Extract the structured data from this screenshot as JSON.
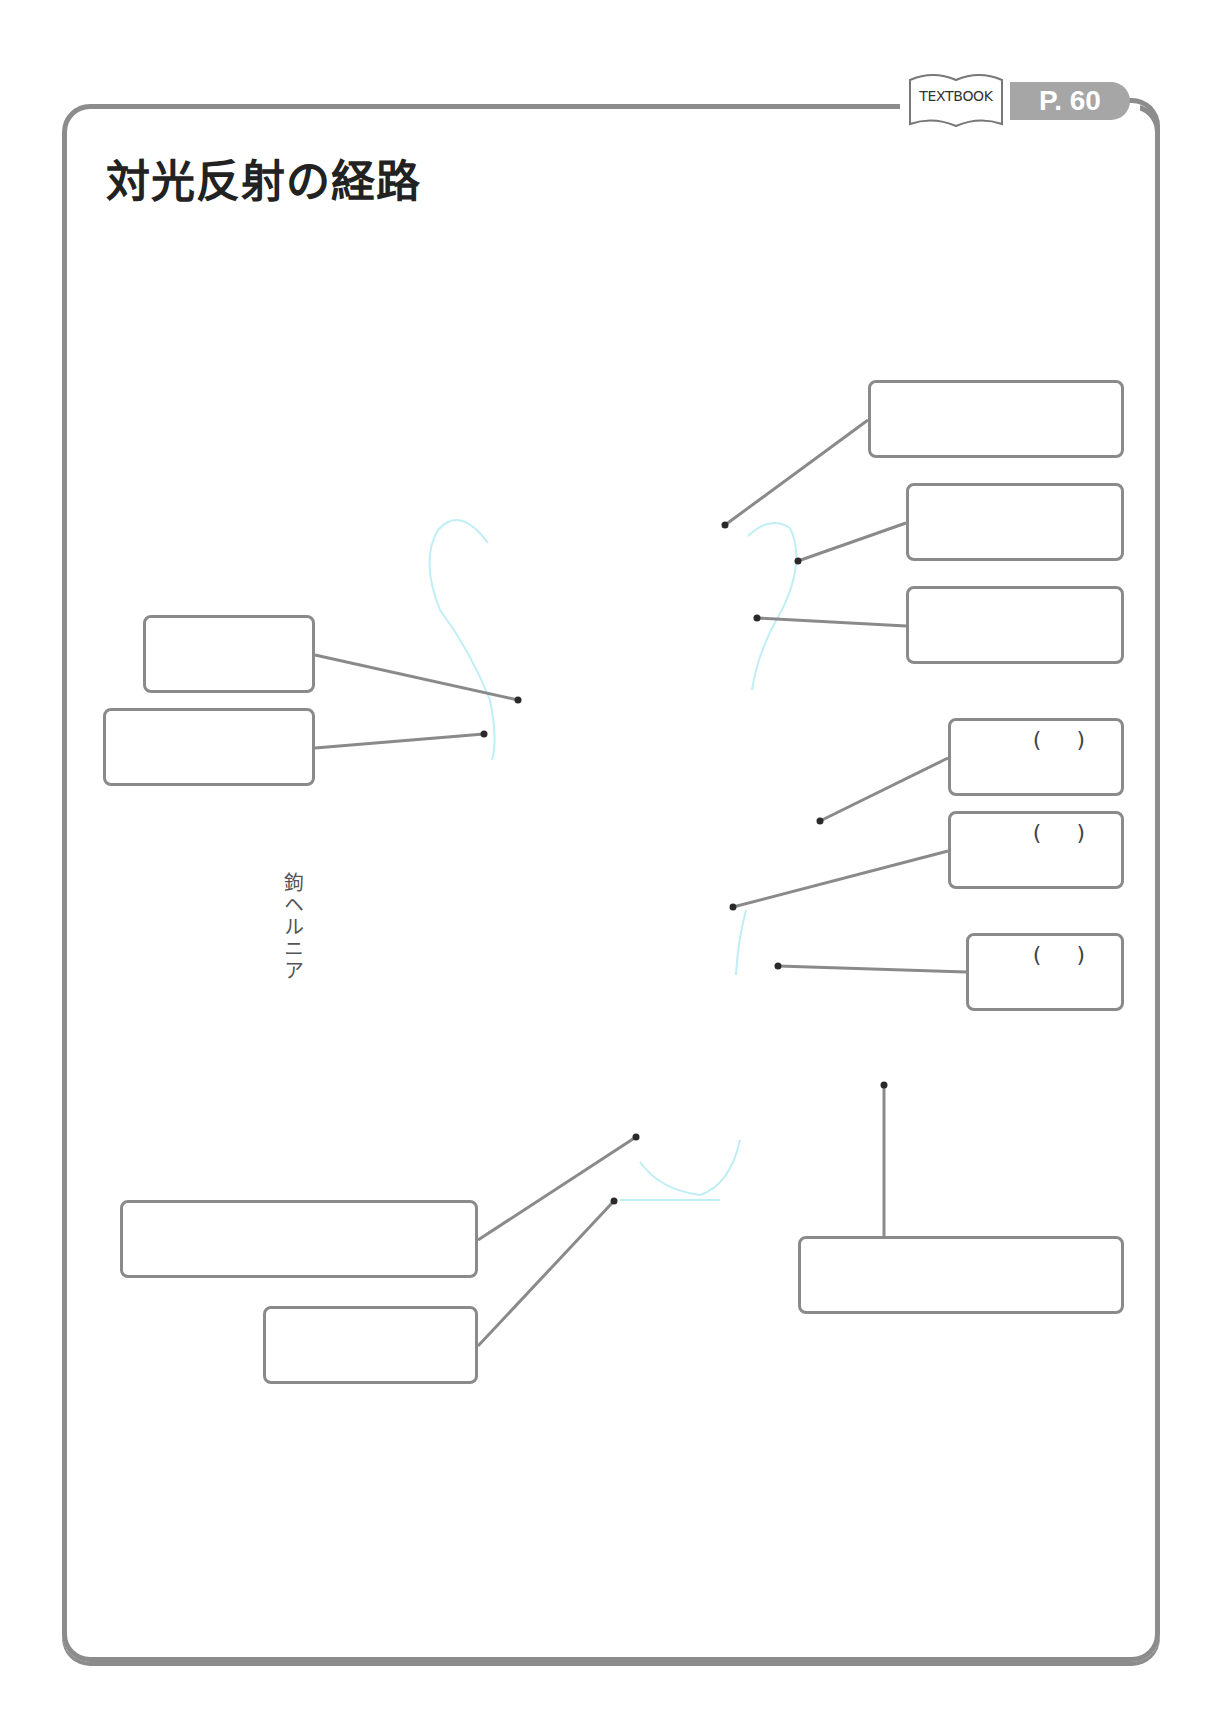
{
  "header": {
    "title": "対光反射の経路",
    "textbook_label": "TEXTBOOK",
    "page_ref": "P. 60"
  },
  "diagram": {
    "outline_color": "#bfeef5",
    "line_color": "#8a8a8a",
    "dot_color": "#2a2a2a",
    "labels": [
      {
        "text": "鉤ヘルニア",
        "orientation": "vertical"
      }
    ],
    "answer_boxes": [
      {
        "id": "box-1",
        "side": "right",
        "x": 868,
        "y": 380,
        "w": 256,
        "h": 78,
        "paren": ""
      },
      {
        "id": "box-2",
        "side": "right",
        "x": 906,
        "y": 483,
        "w": 218,
        "h": 78,
        "paren": ""
      },
      {
        "id": "box-3",
        "side": "right",
        "x": 906,
        "y": 586,
        "w": 218,
        "h": 78,
        "paren": ""
      },
      {
        "id": "box-4",
        "side": "left",
        "x": 143,
        "y": 615,
        "w": 172,
        "h": 78,
        "paren": ""
      },
      {
        "id": "box-5",
        "side": "left",
        "x": 103,
        "y": 708,
        "w": 212,
        "h": 78,
        "paren": ""
      },
      {
        "id": "box-6",
        "side": "right",
        "x": 948,
        "y": 718,
        "w": 176,
        "h": 78,
        "paren": "(  )"
      },
      {
        "id": "box-7",
        "side": "right",
        "x": 948,
        "y": 811,
        "w": 176,
        "h": 78,
        "paren": "(  )"
      },
      {
        "id": "box-8",
        "side": "right",
        "x": 966,
        "y": 933,
        "w": 158,
        "h": 78,
        "paren": "(  )"
      },
      {
        "id": "box-9",
        "side": "left",
        "x": 120,
        "y": 1200,
        "w": 358,
        "h": 78,
        "paren": ""
      },
      {
        "id": "box-10",
        "side": "left",
        "x": 263,
        "y": 1306,
        "w": 215,
        "h": 78,
        "paren": ""
      },
      {
        "id": "box-11",
        "side": "right",
        "x": 798,
        "y": 1236,
        "w": 326,
        "h": 78,
        "paren": ""
      }
    ],
    "leaders": [
      {
        "box": "box-1",
        "from": [
          868,
          420
        ],
        "to": [
          725,
          525
        ]
      },
      {
        "box": "box-2",
        "from": [
          906,
          523
        ],
        "to": [
          798,
          561
        ]
      },
      {
        "box": "box-3",
        "from": [
          906,
          626
        ],
        "to": [
          757,
          618
        ]
      },
      {
        "box": "box-4",
        "from": [
          315,
          655
        ],
        "to": [
          518,
          700
        ]
      },
      {
        "box": "box-5",
        "from": [
          315,
          748
        ],
        "to": [
          484,
          734
        ]
      },
      {
        "box": "box-6",
        "from": [
          948,
          758
        ],
        "to": [
          820,
          821
        ]
      },
      {
        "box": "box-7",
        "from": [
          948,
          851
        ],
        "to": [
          733,
          907
        ]
      },
      {
        "box": "box-8",
        "from": [
          966,
          972
        ],
        "to": [
          778,
          966
        ]
      },
      {
        "box": "box-9",
        "from": [
          478,
          1240
        ],
        "to": [
          636,
          1137
        ]
      },
      {
        "box": "box-10",
        "from": [
          478,
          1346
        ],
        "to": [
          614,
          1201
        ]
      },
      {
        "box": "box-11",
        "from": [
          884,
          1236
        ],
        "to": [
          884,
          1085
        ]
      }
    ]
  }
}
